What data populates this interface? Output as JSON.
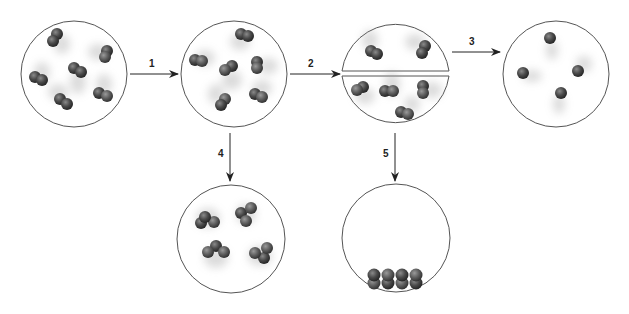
{
  "diagram": {
    "colors": {
      "outline": "#555555",
      "atom_dark": "#3a3a3a",
      "atom_light": "#6a6a6a",
      "arrow": "#222222",
      "blur": "#cfcfcf"
    },
    "steps": [
      {
        "id": "1",
        "label": "1"
      },
      {
        "id": "2",
        "label": "2"
      },
      {
        "id": "3",
        "label": "3"
      },
      {
        "id": "4",
        "label": "4"
      },
      {
        "id": "5",
        "label": "5"
      }
    ],
    "states": [
      {
        "name": "diatomic-gas-initial",
        "molecules": 6,
        "atoms_per_molecule": 2
      },
      {
        "name": "diatomic-gas-moving",
        "molecules": 6,
        "atoms_per_molecule": 2
      },
      {
        "name": "split-container",
        "molecules": 6,
        "atoms_per_molecule": 2,
        "top_half": 2,
        "bottom_half": 4
      },
      {
        "name": "monatomic-gas",
        "molecules": 4,
        "atoms_per_molecule": 1
      },
      {
        "name": "clustered-molecules",
        "molecules": 4,
        "atoms_per_molecule": 3
      },
      {
        "name": "condensed-liquid",
        "molecules": 4,
        "atoms_per_molecule": 2
      }
    ]
  }
}
